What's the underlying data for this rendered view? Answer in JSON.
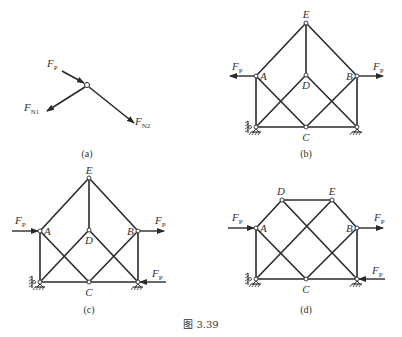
{
  "figure": {
    "caption": "图 3.39",
    "panels": [
      {
        "id": "a",
        "caption": "(a)",
        "description": "Free body of joint with three forces",
        "forces": [
          {
            "name": "F",
            "sub": "P",
            "direction": "incoming from upper-left"
          },
          {
            "name": "F",
            "sub": "N1",
            "direction": "outgoing to lower-left"
          },
          {
            "name": "F",
            "sub": "N2",
            "direction": "outgoing to lower-right"
          }
        ]
      },
      {
        "id": "b",
        "caption": "(b)",
        "nodes": [
          "E",
          "A",
          "D",
          "B",
          "C"
        ],
        "loads": [
          {
            "name": "F",
            "sub": "P",
            "at": "A",
            "direction": "left"
          },
          {
            "name": "F",
            "sub": "P",
            "at": "B",
            "direction": "right"
          }
        ]
      },
      {
        "id": "c",
        "caption": "(c)",
        "nodes": [
          "E",
          "A",
          "D",
          "B",
          "C"
        ],
        "loads": [
          {
            "name": "F",
            "sub": "P",
            "at": "A",
            "direction": "right"
          },
          {
            "name": "F",
            "sub": "P",
            "at": "B",
            "direction": "right"
          },
          {
            "name": "F",
            "sub": "P",
            "at": "bottom-right support",
            "direction": "left"
          }
        ]
      },
      {
        "id": "d",
        "caption": "(d)",
        "nodes": [
          "D",
          "E",
          "A",
          "B",
          "C"
        ],
        "loads": [
          {
            "name": "F",
            "sub": "P",
            "at": "A",
            "direction": "right"
          },
          {
            "name": "F",
            "sub": "P",
            "at": "B",
            "direction": "right"
          },
          {
            "name": "F",
            "sub": "P",
            "at": "bottom-right support",
            "direction": "left"
          }
        ]
      }
    ]
  },
  "labels": {
    "F": "F",
    "P": "P",
    "N1": "N1",
    "N2": "N2",
    "A": "A",
    "B": "B",
    "C": "C",
    "D": "D",
    "E": "E",
    "cap_a": "(a)",
    "cap_b": "(b)",
    "cap_c": "(c)",
    "cap_d": "(d)",
    "fig": "图 3.39"
  },
  "colors": {
    "line": "#2a2a2a",
    "background": "#ffffff"
  }
}
